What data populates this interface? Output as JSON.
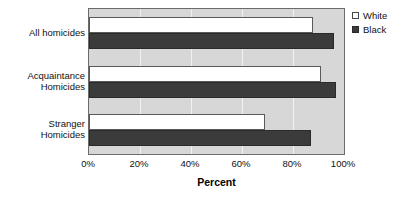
{
  "chart_data": {
    "type": "bar",
    "orientation": "horizontal",
    "title": "",
    "xlabel": "Percent",
    "ylabel": "",
    "xlim": [
      0,
      100
    ],
    "xticks": [
      "0%",
      "20%",
      "40%",
      "60%",
      "80%",
      "100%"
    ],
    "xtick_values": [
      0,
      20,
      40,
      60,
      80,
      100
    ],
    "grid": true,
    "legend_position": "top-right",
    "categories": [
      "All homicides",
      "Acquaintance\nHomicides",
      "Stranger\nHomicides"
    ],
    "series": [
      {
        "name": "White",
        "color": "#ffffff",
        "values": [
          88,
          91,
          69
        ]
      },
      {
        "name": "Black",
        "color": "#3b3b3b",
        "values": [
          96,
          97,
          87
        ]
      }
    ]
  },
  "legend": {
    "items": [
      {
        "label": "White",
        "swatch": "hollow-square"
      },
      {
        "label": "Black",
        "swatch": "filled-square"
      }
    ]
  }
}
